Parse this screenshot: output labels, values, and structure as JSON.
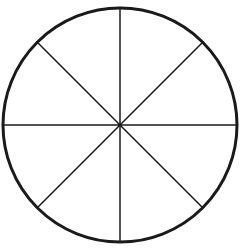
{
  "diagram": {
    "type": "circle-divided-into-sectors",
    "sector_count": 8,
    "center": [
      120,
      125
    ],
    "radius": 117,
    "stroke_color": "#1a1a1a",
    "background_color": "#ffffff",
    "circle_stroke_width": 3,
    "line_stroke_width": 1.5,
    "divider_angles_deg": [
      0,
      45,
      90,
      135
    ]
  }
}
